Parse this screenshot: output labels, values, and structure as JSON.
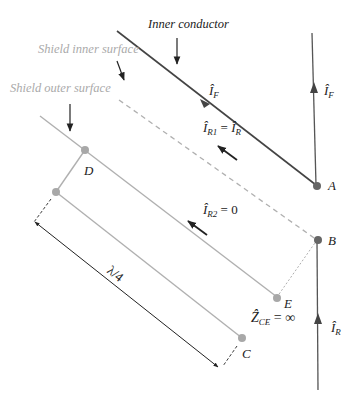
{
  "labels": {
    "inner_conductor": "Inner conductor",
    "shield_inner_surface": "Shield inner surface",
    "shield_outer_surface": "Shield outer surface"
  },
  "points": {
    "A": "A",
    "B": "B",
    "C": "C",
    "D": "D",
    "E": "E"
  },
  "currents": {
    "IF_inner": {
      "symbol": "Î",
      "sub": "F"
    },
    "IF_right": {
      "symbol": "Î",
      "sub": "F"
    },
    "IR1": {
      "symbol": "Î",
      "sub": "R1",
      "eq": " = ",
      "rhs_symbol": "Î",
      "rhs_sub": "R"
    },
    "IR2": {
      "symbol": "Î",
      "sub": "R2",
      "eq": " = ",
      "rhs": "0"
    },
    "IR_right": {
      "symbol": "Î",
      "sub": "R"
    }
  },
  "impedance": {
    "symbol": "Ẑ",
    "sub": "CE",
    "eq": " = ",
    "rhs": "∞"
  },
  "dimension": {
    "label": "λ/4"
  },
  "colors": {
    "dark_line": "#444444",
    "gray_line": "#b0b0b0",
    "dot_dark": "#666666",
    "dot_gray": "#a8a8a8",
    "gray_text": "#aaaaaa"
  }
}
